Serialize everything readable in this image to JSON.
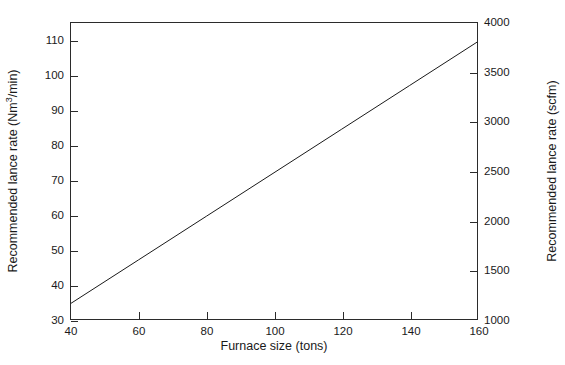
{
  "chart_data": {
    "type": "line",
    "title": "",
    "xlabel": "Furnace size (tons)",
    "ylabel": "Recommended lance rate (Nm3/min)",
    "ylabel_right": "Recommended lance rate (scfm)",
    "xlim": [
      40,
      160
    ],
    "ylim": [
      30,
      115
    ],
    "ylim_right": [
      1000,
      4000
    ],
    "grid": false,
    "legend": null,
    "xticks": [
      40,
      60,
      80,
      100,
      120,
      140,
      160
    ],
    "xticklabels": [
      "40",
      "60",
      "80",
      "100",
      "120",
      "140",
      "160"
    ],
    "yticks": [
      30,
      40,
      50,
      60,
      70,
      80,
      90,
      100,
      110
    ],
    "yticklabels": [
      "30",
      "40",
      "50",
      "60",
      "70",
      "80",
      "90",
      "100",
      "110"
    ],
    "yticks_right": [
      1000,
      1500,
      2000,
      2500,
      3000,
      3500,
      4000
    ],
    "yticklabels_right": [
      "1000",
      "1500",
      "2000",
      "2500",
      "3000",
      "3500",
      "4000"
    ],
    "series": [
      {
        "name": "Recommended lance rate",
        "color": "#1a1a1a",
        "linewidth": 1,
        "x": [
          40,
          60,
          80,
          100,
          120,
          140,
          160
        ],
        "values": [
          34.5,
          47,
          59.5,
          72,
          84.5,
          97,
          109.5
        ]
      }
    ]
  },
  "axes": {
    "left_title_pre": "Recommended lance rate (Nm",
    "left_title_sup": "3",
    "left_title_post": "/min)",
    "right_title": "Recommended lance rate (scfm)",
    "bottom_title": "Furnace size (tons)"
  },
  "colors": {
    "background": "#ffffff",
    "frame": "#2b2b2b",
    "text": "#1a1a1a",
    "line": "#1a1a1a"
  }
}
